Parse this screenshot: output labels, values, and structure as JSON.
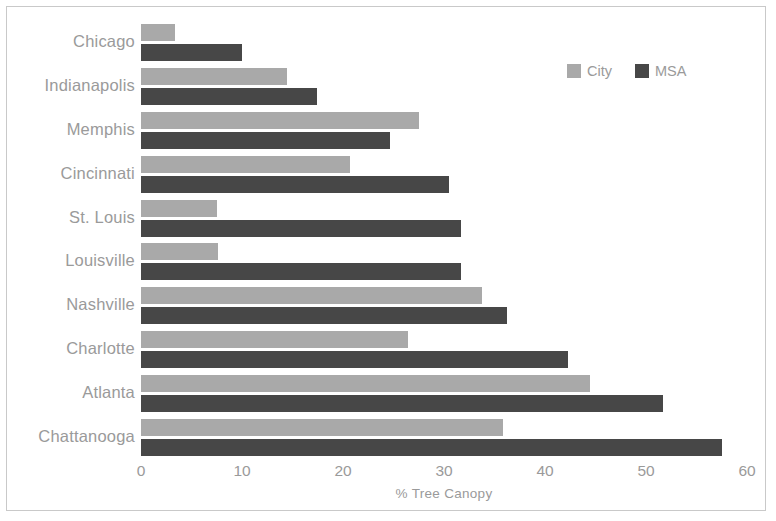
{
  "chart_data": {
    "type": "bar",
    "orientation": "horizontal",
    "title": "",
    "xlabel": "% Tree Canopy",
    "ylabel": "",
    "xlim": [
      0,
      60
    ],
    "xticks": [
      0,
      10,
      20,
      30,
      40,
      50,
      60
    ],
    "grid": false,
    "legend_position": "top-right",
    "categories": [
      "Chicago",
      "Indianapolis",
      "Memphis",
      "Cincinnati",
      "St. Louis",
      "Louisville",
      "Nashville",
      "Charlotte",
      "Atlanta",
      "Chattanooga"
    ],
    "series": [
      {
        "name": "City",
        "color": "#a9a9a9",
        "values": [
          3.4,
          14.5,
          27.5,
          20.7,
          7.5,
          7.6,
          33.8,
          26.4,
          44.5,
          35.8
        ]
      },
      {
        "name": "MSA",
        "color": "#474747",
        "values": [
          10.0,
          17.4,
          24.7,
          30.5,
          31.7,
          31.7,
          36.2,
          42.3,
          51.7,
          57.5
        ]
      }
    ]
  },
  "legend": {
    "items": [
      {
        "label": "City",
        "color": "#a9a9a9"
      },
      {
        "label": "MSA",
        "color": "#474747"
      }
    ]
  }
}
